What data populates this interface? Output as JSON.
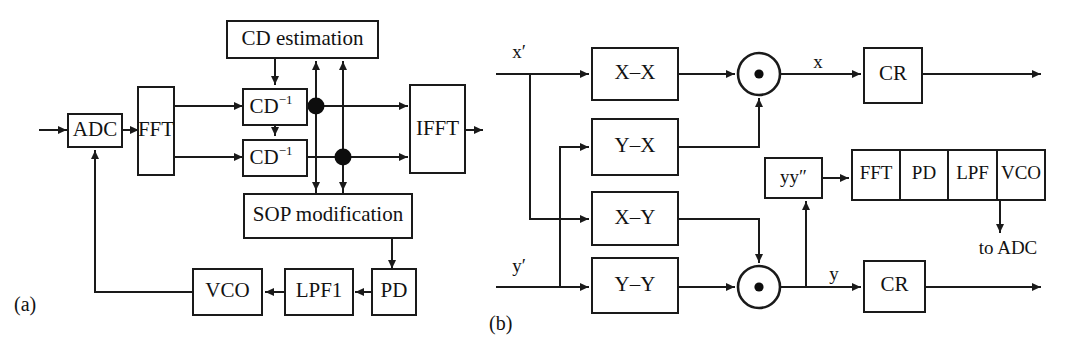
{
  "figure": {
    "panels": [
      {
        "id": "a",
        "caption": "(a)"
      },
      {
        "id": "b",
        "caption": "(b)"
      }
    ]
  },
  "panel_a": {
    "caption": "(a)",
    "blocks": [
      {
        "id": "adc",
        "label": "ADC"
      },
      {
        "id": "fft",
        "label": "FFT"
      },
      {
        "id": "cd_estimation",
        "label": "CD estimation"
      },
      {
        "id": "cd_inv_1",
        "label": "CD",
        "superscript": "−1"
      },
      {
        "id": "cd_inv_2",
        "label": "CD",
        "superscript": "−1"
      },
      {
        "id": "ifft",
        "label": "IFFT"
      },
      {
        "id": "sop_modification",
        "label": "SOP modification"
      },
      {
        "id": "pd",
        "label": "PD"
      },
      {
        "id": "lpf1",
        "label": "LPF1"
      },
      {
        "id": "vco",
        "label": "VCO"
      }
    ]
  },
  "panel_b": {
    "caption": "(b)",
    "inputs": [
      {
        "id": "x_in",
        "label": "x′"
      },
      {
        "id": "y_in",
        "label": "y′"
      }
    ],
    "filters": [
      {
        "id": "xx",
        "label": "X–X"
      },
      {
        "id": "yx",
        "label": "Y–X"
      },
      {
        "id": "xy",
        "label": "X–Y"
      },
      {
        "id": "yy",
        "label": "Y–Y"
      }
    ],
    "combiners": [
      {
        "id": "mul_top",
        "symbol": "⊙"
      },
      {
        "id": "mul_bottom",
        "symbol": "⊙"
      }
    ],
    "signals": [
      {
        "id": "sig_x",
        "label": "x"
      },
      {
        "id": "sig_y",
        "label": "y"
      }
    ],
    "blocks": [
      {
        "id": "cr_top",
        "label": "CR"
      },
      {
        "id": "cr_bottom",
        "label": "CR"
      },
      {
        "id": "yy_prime",
        "label": "yy″"
      }
    ],
    "pll_chain": {
      "id": "pll_chain",
      "cells": [
        {
          "id": "pll_fft",
          "label": "FFT"
        },
        {
          "id": "pll_pd",
          "label": "PD"
        },
        {
          "id": "pll_lpf",
          "label": "LPF"
        },
        {
          "id": "pll_vco",
          "label": "VCO"
        }
      ]
    },
    "annotations": [
      {
        "id": "to_adc",
        "label": "to ADC"
      }
    ]
  },
  "colors": {
    "line": "#1a1a1a",
    "text": "#121212",
    "fill": "#ffffff",
    "dot": "#0d0d0d"
  }
}
